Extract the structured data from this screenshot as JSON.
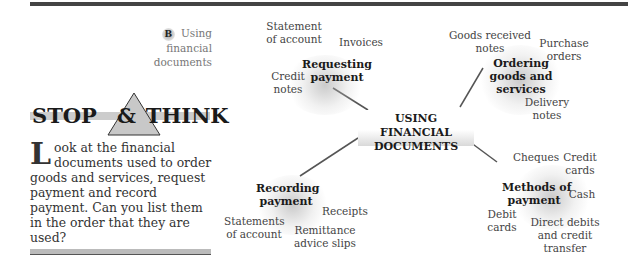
{
  "section": {
    "badge": "B",
    "title_line1": "Using financial",
    "title_line2": "documents"
  },
  "stop_and_think": {
    "heading_left": "STOP",
    "heading_amp": "&",
    "heading_right": "THINK",
    "dropcap": "L",
    "body": "ook at the financial documents used to order goods and services, request payment and record payment. Can you list them in the order that they are used?"
  },
  "mind_map": {
    "center": {
      "line1": "USING FINANCIAL",
      "line2": "DOCUMENTS"
    },
    "branches": [
      {
        "hub": [
          "Requesting",
          "payment"
        ],
        "leaves": [
          [
            "Statement",
            "of account"
          ],
          [
            "Invoices"
          ],
          [
            "Credit",
            "notes"
          ]
        ]
      },
      {
        "hub": [
          "Ordering",
          "goods and",
          "services"
        ],
        "leaves": [
          [
            "Goods received",
            "notes"
          ],
          [
            "Purchase",
            "orders"
          ],
          [
            "Delivery",
            "notes"
          ]
        ]
      },
      {
        "hub": [
          "Recording",
          "payment"
        ],
        "leaves": [
          [
            "Statements",
            "of account"
          ],
          [
            "Receipts"
          ],
          [
            "Remittance",
            "advice slips"
          ]
        ]
      },
      {
        "hub": [
          "Methods of",
          "payment"
        ],
        "leaves": [
          [
            "Cheques"
          ],
          [
            "Credit",
            "cards"
          ],
          [
            "Cash"
          ],
          [
            "Debit",
            "cards"
          ],
          [
            "Direct debits",
            "and credit",
            "transfer"
          ]
        ]
      }
    ]
  }
}
